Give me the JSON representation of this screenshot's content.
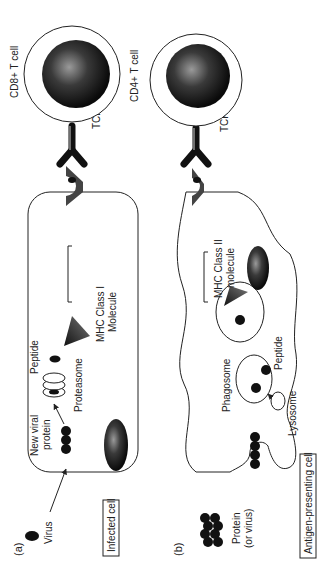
{
  "panels": {
    "a": {
      "label": "(a)",
      "virus_label": "Virus",
      "new_viral_protein_line1": "New viral",
      "new_viral_protein_line2": "protein",
      "proteasome_label": "Proteasome",
      "peptide_label": "Peptide",
      "mhc_line1": "MHC Class I",
      "mhc_line2": "Molecule",
      "cell_box_label": "Infected cell",
      "tcr_label": "TCR",
      "t_cell_label": "CD8+ T cell"
    },
    "b": {
      "label": "(b)",
      "protein_line1": "Protein",
      "protein_line2": "(or virus)",
      "phagosome_label": "Phagosome",
      "peptide_label": "Peptide",
      "lysosome_label": "Lysosome",
      "mhc_line1": "MHC Class II",
      "mhc_line2": "molecule",
      "cell_box_label": "Antigen-presenting cell",
      "tcr_label": "TCR",
      "t_cell_label": "CD4+ T cell"
    }
  },
  "colors": {
    "stroke": "#222222",
    "fill_dark": "#111111",
    "nucleus_mid": "#555555",
    "background": "#ffffff"
  }
}
